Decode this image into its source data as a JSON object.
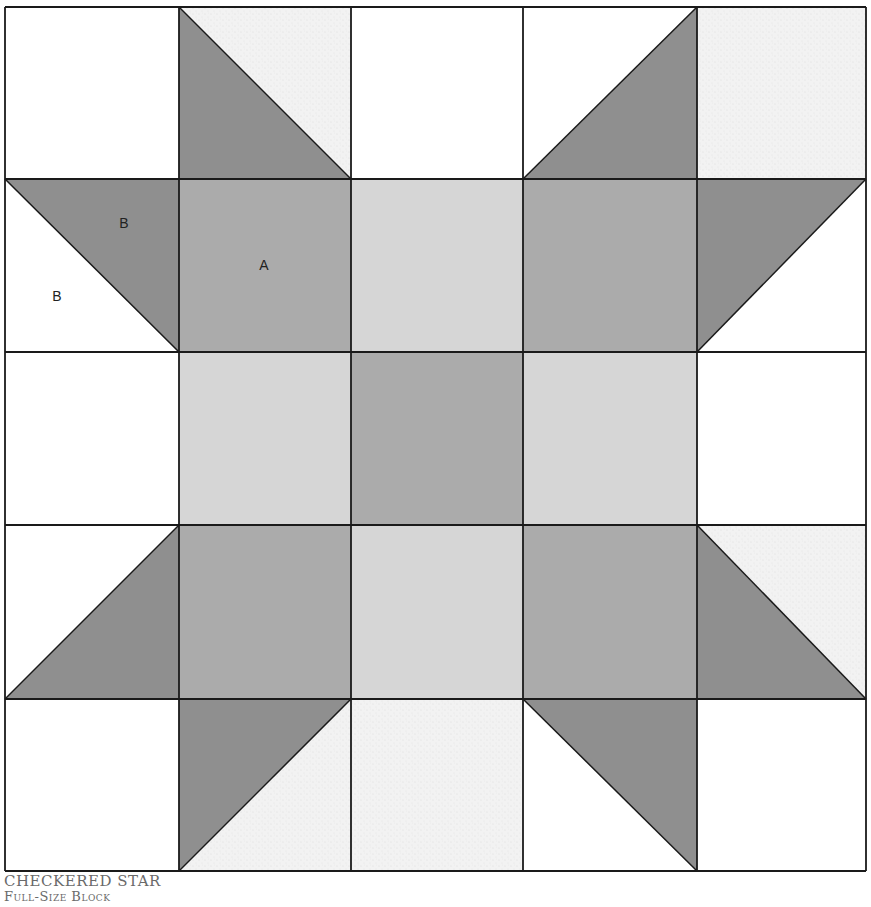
{
  "caption": {
    "title": "Checkered Star",
    "subtitle": "Full-Size Block"
  },
  "colors": {
    "outline": "#1a1a1a",
    "dark": "#8f8f8f",
    "medium": "#ababab",
    "light": "#d6d6d6",
    "background_white": "#ffffff",
    "background_speckle": "#efefef"
  },
  "grid": {
    "xs": [
      5,
      179,
      351,
      523,
      697,
      866
    ],
    "ys": [
      7,
      179,
      352,
      525,
      699,
      871
    ]
  },
  "cells": [
    {
      "row": 0,
      "col": 0,
      "type": "square",
      "fill": "background_white"
    },
    {
      "row": 0,
      "col": 1,
      "type": "hst",
      "diagonal": "tl-br",
      "lower_left": "dark",
      "upper_right": "background_speckle"
    },
    {
      "row": 0,
      "col": 2,
      "type": "square",
      "fill": "background_white"
    },
    {
      "row": 0,
      "col": 3,
      "type": "hst",
      "diagonal": "bl-tr",
      "upper_left": "background_white",
      "lower_right": "dark"
    },
    {
      "row": 0,
      "col": 4,
      "type": "square",
      "fill": "background_speckle"
    },
    {
      "row": 1,
      "col": 0,
      "type": "hst",
      "diagonal": "tl-br",
      "lower_left": "background_white",
      "upper_right": "dark"
    },
    {
      "row": 1,
      "col": 1,
      "type": "square",
      "fill": "medium"
    },
    {
      "row": 1,
      "col": 2,
      "type": "square",
      "fill": "light"
    },
    {
      "row": 1,
      "col": 3,
      "type": "square",
      "fill": "medium"
    },
    {
      "row": 1,
      "col": 4,
      "type": "hst",
      "diagonal": "bl-tr",
      "upper_left": "dark",
      "lower_right": "background_white"
    },
    {
      "row": 2,
      "col": 0,
      "type": "square",
      "fill": "background_white"
    },
    {
      "row": 2,
      "col": 1,
      "type": "square",
      "fill": "light"
    },
    {
      "row": 2,
      "col": 2,
      "type": "square",
      "fill": "medium"
    },
    {
      "row": 2,
      "col": 3,
      "type": "square",
      "fill": "light"
    },
    {
      "row": 2,
      "col": 4,
      "type": "square",
      "fill": "background_white"
    },
    {
      "row": 3,
      "col": 0,
      "type": "hst",
      "diagonal": "bl-tr",
      "upper_left": "background_white",
      "lower_right": "dark"
    },
    {
      "row": 3,
      "col": 1,
      "type": "square",
      "fill": "medium"
    },
    {
      "row": 3,
      "col": 2,
      "type": "square",
      "fill": "light"
    },
    {
      "row": 3,
      "col": 3,
      "type": "square",
      "fill": "medium"
    },
    {
      "row": 3,
      "col": 4,
      "type": "hst",
      "diagonal": "tl-br",
      "lower_left": "dark",
      "upper_right": "background_speckle"
    },
    {
      "row": 4,
      "col": 0,
      "type": "square",
      "fill": "background_white"
    },
    {
      "row": 4,
      "col": 1,
      "type": "hst",
      "diagonal": "bl-tr",
      "upper_left": "dark",
      "lower_right": "background_speckle"
    },
    {
      "row": 4,
      "col": 2,
      "type": "square",
      "fill": "background_speckle"
    },
    {
      "row": 4,
      "col": 3,
      "type": "hst",
      "diagonal": "tl-br",
      "lower_left": "background_white",
      "upper_right": "dark"
    },
    {
      "row": 4,
      "col": 4,
      "type": "square",
      "fill": "background_white"
    }
  ],
  "labels": [
    {
      "text": "B",
      "x": 124,
      "y": 228,
      "piece": "dark triangle"
    },
    {
      "text": "B",
      "x": 57,
      "y": 301,
      "piece": "light triangle"
    },
    {
      "text": "A",
      "x": 264,
      "y": 270,
      "piece": "square"
    }
  ]
}
